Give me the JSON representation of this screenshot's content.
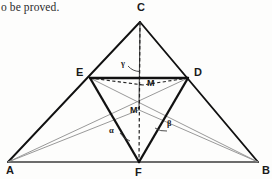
{
  "page": {
    "caption": "o be proved.",
    "width": 272,
    "height": 179,
    "background": "#fdfdfc"
  },
  "figure": {
    "name": "triangle-cevian-diagram",
    "colors": {
      "bold_stroke": "#111111",
      "thin_stroke": "#4a4a4a",
      "light_stroke": "#8d8d8d",
      "dashed_stroke": "#222222",
      "dotted_stroke": "#9a9a9a",
      "label_color": "#1a1a1a"
    },
    "points": {
      "A": {
        "label": "A",
        "x": 8,
        "y": 162,
        "label_x": 6,
        "label_y": 174
      },
      "B": {
        "label": "B",
        "x": 258,
        "y": 162,
        "label_x": 262,
        "label_y": 174
      },
      "C": {
        "label": "C",
        "x": 140,
        "y": 22,
        "label_x": 137,
        "label_y": 11
      },
      "D": {
        "label": "D",
        "x": 188,
        "y": 78,
        "label_x": 194,
        "label_y": 76
      },
      "E": {
        "label": "E",
        "x": 90,
        "y": 78,
        "label_x": 76,
        "label_y": 76
      },
      "F": {
        "label": "F",
        "x": 139,
        "y": 162,
        "label_x": 135,
        "label_y": 176
      },
      "M": {
        "label": "M",
        "x": 143,
        "y": 85,
        "label_x": 147,
        "label_y": 86
      },
      "Mp": {
        "label": "M'",
        "x": 139,
        "y": 110,
        "label_x": 130,
        "label_y": 113
      }
    },
    "angles": [
      {
        "name": "gamma",
        "label": "γ",
        "at": "C",
        "label_x": 121,
        "label_y": 66
      },
      {
        "name": "alpha",
        "label": "α",
        "at": "F",
        "label_x": 109,
        "label_y": 133
      },
      {
        "name": "beta",
        "label": "β",
        "at": "F",
        "label_x": 167,
        "label_y": 126
      }
    ],
    "segments": [
      {
        "name": "edge-A-C",
        "from": "A",
        "to": "C",
        "style": "bold"
      },
      {
        "name": "edge-C-B",
        "from": "C",
        "to": "B",
        "style": "bold"
      },
      {
        "name": "edge-A-B",
        "from": "A",
        "to": "B",
        "style": "base"
      },
      {
        "name": "edge-E-D",
        "from": "E",
        "to": "D",
        "style": "bold"
      },
      {
        "name": "edge-E-F",
        "from": "E",
        "to": "F",
        "style": "bold"
      },
      {
        "name": "edge-D-F",
        "from": "D",
        "to": "F",
        "style": "bold"
      },
      {
        "name": "cevian-C-M",
        "from": "C",
        "to": "Mp",
        "style": "thin"
      },
      {
        "name": "cevian-C-F",
        "from": "C",
        "to": "F",
        "style": "dashed"
      },
      {
        "name": "cevian-A-D",
        "from": "A",
        "to": "D",
        "style": "light"
      },
      {
        "name": "cevian-A-M",
        "from": "A",
        "to": "Mp",
        "style": "light"
      },
      {
        "name": "cevian-B-E",
        "from": "B",
        "to": "E",
        "style": "light"
      },
      {
        "name": "cevian-B-M",
        "from": "B",
        "to": "Mp",
        "style": "light"
      },
      {
        "name": "chord-E-M",
        "from": "E",
        "to": "M",
        "style": "dashed"
      },
      {
        "name": "chord-D-M",
        "from": "D",
        "to": "M",
        "style": "dashed"
      },
      {
        "name": "dotted-F-E",
        "from": "F",
        "to": "E",
        "style": "dotted"
      },
      {
        "name": "dotted-F-D",
        "from": "F",
        "to": "D",
        "style": "dotted"
      }
    ]
  }
}
